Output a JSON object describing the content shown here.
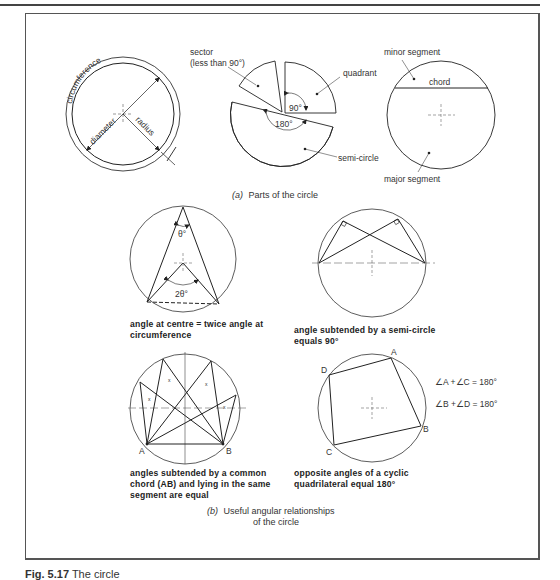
{
  "figure": {
    "caption_number": "Fig. 5.17",
    "caption_title": "The circle"
  },
  "part_a": {
    "caption_prefix": "(a)",
    "caption": "Parts of the circle",
    "circle1": {
      "labels": {
        "circumference": "circumference",
        "diameter": "diameter",
        "radius": "radius"
      }
    },
    "circle2": {
      "labels": {
        "sector_line1": "sector",
        "sector_line2": "(less than 90°)",
        "quadrant": "quadrant",
        "angle_90": "90°",
        "angle_180": "180°",
        "semi_circle": "semi-circle"
      }
    },
    "circle3": {
      "labels": {
        "minor_segment": "minor segment",
        "chord": "chord",
        "major_segment": "major segment"
      }
    }
  },
  "part_b": {
    "caption_prefix": "(b)",
    "caption_line1": "Useful angular relationships",
    "caption_line2": "of the circle",
    "diagrams": [
      {
        "id": "centre-angle",
        "angle_top": "θ°",
        "angle_centre": "2θ°",
        "desc_line1": "angle at centre = twice angle at",
        "desc_line2": "circumference"
      },
      {
        "id": "semicircle-angle",
        "desc_line1": "angle subtended by a semi-circle",
        "desc_line2": "equals 90°"
      },
      {
        "id": "common-chord",
        "point_a": "A",
        "point_b": "B",
        "angle_mark": "x",
        "desc_line1": "angles subtended by a common",
        "desc_line2": "chord (AB) and lying in the same",
        "desc_line3": "segment are equal"
      },
      {
        "id": "cyclic-quad",
        "point_a": "A",
        "point_b": "B",
        "point_c": "C",
        "point_d": "D",
        "eq1": "∠A +∠C = 180°",
        "eq2": "∠B +∠D = 180°",
        "desc_line1": "opposite angles of a cyclic",
        "desc_line2": "quadrilateral equal 180°"
      }
    ]
  }
}
